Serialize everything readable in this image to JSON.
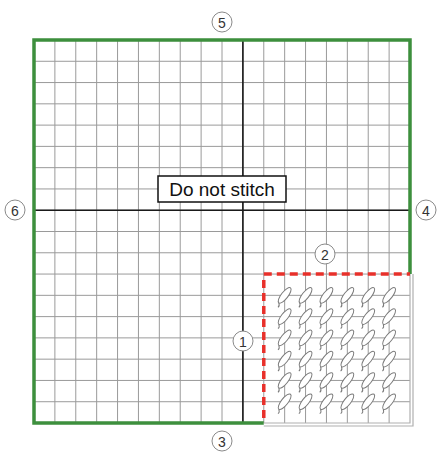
{
  "diagram": {
    "label": "Do not stitch",
    "grid": {
      "columns": 18,
      "rows": 18,
      "left": 34,
      "top": 40,
      "right": 410,
      "bottom": 423,
      "center_column": 10,
      "center_row": 8
    },
    "stitched_region": {
      "col_start": 11,
      "row_start": 11,
      "col_end": 18,
      "row_end": 18,
      "stitch_cols": [
        12,
        13,
        14,
        15,
        16,
        17
      ],
      "stitch_rows": [
        12,
        13,
        14,
        15,
        16,
        17
      ]
    },
    "markers": [
      {
        "id": "1",
        "x": 243,
        "y": 341
      },
      {
        "id": "2",
        "x": 325,
        "y": 254
      },
      {
        "id": "3",
        "x": 222,
        "y": 441
      },
      {
        "id": "4",
        "x": 426,
        "y": 210
      },
      {
        "id": "5",
        "x": 222,
        "y": 22
      },
      {
        "id": "6",
        "x": 15,
        "y": 210
      }
    ],
    "colors": {
      "border": "#3d8f3d",
      "grid_line": "#9a9a9a",
      "center_line": "#1a1a1a",
      "dashed_boundary": "#e8302a",
      "stitched_border": "#b0b0b0",
      "stitch_outline": "#7a7a7a",
      "marker_outline": "#8a8a8a"
    }
  }
}
